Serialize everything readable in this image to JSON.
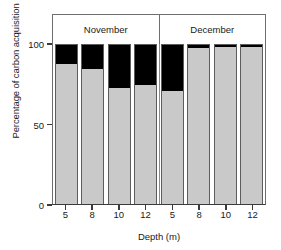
{
  "chart_data": {
    "type": "bar",
    "title": "",
    "subtitle": "",
    "stacked": true,
    "xlabel": "Depth (m)",
    "ylabel": "Percentage of carbon acquisition",
    "ylim": [
      0,
      100
    ],
    "yticks": [
      0,
      50,
      100
    ],
    "ytick_labels": [
      "0",
      "50",
      "100"
    ],
    "grid": false,
    "legend_position": "none",
    "groups": [
      {
        "label": "November",
        "n": 4
      },
      {
        "label": "December",
        "n": 4
      }
    ],
    "categories": [
      "5",
      "8",
      "10",
      "12",
      "5",
      "8",
      "10",
      "12"
    ],
    "xtick_labels": [
      "5",
      "8",
      "10",
      "12",
      "5",
      "8",
      "10",
      "12"
    ],
    "series": [
      {
        "name": "gray-component",
        "color": "#c9c9c9",
        "values": [
          88,
          85,
          73,
          75,
          71,
          98,
          99,
          99
        ]
      },
      {
        "name": "black-component",
        "color": "#000000",
        "values": [
          12,
          15,
          27,
          25,
          29,
          2,
          1,
          1
        ]
      }
    ]
  },
  "axes": {
    "ytick_labels": [
      "100",
      "50",
      "0"
    ],
    "ytick_values": [
      100,
      50,
      0
    ]
  },
  "colors": {
    "gray": "#c9c9c9",
    "black": "#000000",
    "frame": "#6f6f6f",
    "axis": "#3a3a3a",
    "text": "#1a1a1a"
  }
}
